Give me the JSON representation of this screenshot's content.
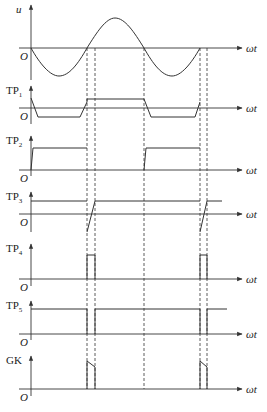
{
  "figure": {
    "width": 267,
    "height": 412,
    "axis_x": 31,
    "axis_x_end": 242,
    "stroke_color": "#333333",
    "x_label": "ωt",
    "origin_label": "O",
    "dashed_lines": [
      87,
      95,
      144,
      200,
      207
    ],
    "dashed_span": [
      48,
      389
    ]
  },
  "panels": [
    {
      "id": "u",
      "label": "u",
      "label_sub": "",
      "italic": true,
      "baseline_y": 48,
      "axis_top": 5,
      "axis_bottom": 80,
      "path": "M31,48 C40,64 50,76 59,76 C69,76 78,64 87,48 C97,32 106,18 115,18 C125,18 134,32 144,48 C153,64 162,76 172,76 C181,76 191,64 200,48"
    },
    {
      "id": "tp1",
      "label": "TP",
      "label_sub": "1",
      "italic": false,
      "baseline_y": 108,
      "axis_top": 86,
      "axis_bottom": 124,
      "path": "M31,98 L38,117 L80,117 L87,102 L87,99 L144,99 L151,117 L195,117 L200,102"
    },
    {
      "id": "tp2",
      "label": "TP",
      "label_sub": "2",
      "italic": false,
      "baseline_y": 170,
      "axis_top": 136,
      "axis_bottom": 176,
      "path": "M31,170 L33,148 L87,148 M144,170 L146,148 L200,148"
    },
    {
      "id": "tp3",
      "label": "TP",
      "label_sub": "3",
      "italic": false,
      "baseline_y": 214,
      "axis_top": 192,
      "axis_bottom": 232,
      "path": "M31,201 L87,201 M87,232 L95,201 L200,201 M200,232 L207,201 L222,201"
    },
    {
      "id": "tp4",
      "label": "TP",
      "label_sub": "4",
      "italic": false,
      "baseline_y": 279,
      "axis_top": 244,
      "axis_bottom": 286,
      "path": "M87,279 L87,255 L95,255 L95,279 M200,279 L200,255 L207,255 L207,279"
    },
    {
      "id": "tp5",
      "label": "TP",
      "label_sub": "5",
      "italic": false,
      "baseline_y": 334,
      "axis_top": 301,
      "axis_bottom": 340,
      "path": "M31,309 L87,309 L87,334 M95,334 L95,309 L200,309 L200,334 M207,334 L207,309 L227,309"
    },
    {
      "id": "gk",
      "label": "GK",
      "label_sub": "",
      "italic": false,
      "baseline_y": 389,
      "axis_top": 356,
      "axis_bottom": 396,
      "path": "M87,389 L87,361 L95,367 L95,389 M200,389 L200,361 L207,367 L207,389"
    }
  ]
}
